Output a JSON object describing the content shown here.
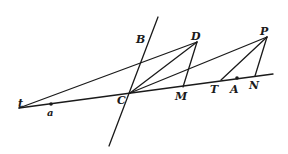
{
  "diagram": {
    "labels": {
      "t": "t",
      "a": "a",
      "C": "C",
      "B": "B",
      "D": "D",
      "M": "M",
      "P": "P",
      "T": "T",
      "A": "A",
      "N": "N"
    },
    "colors": {
      "ink": "#1a1a1a",
      "background": "#ffffff"
    }
  }
}
